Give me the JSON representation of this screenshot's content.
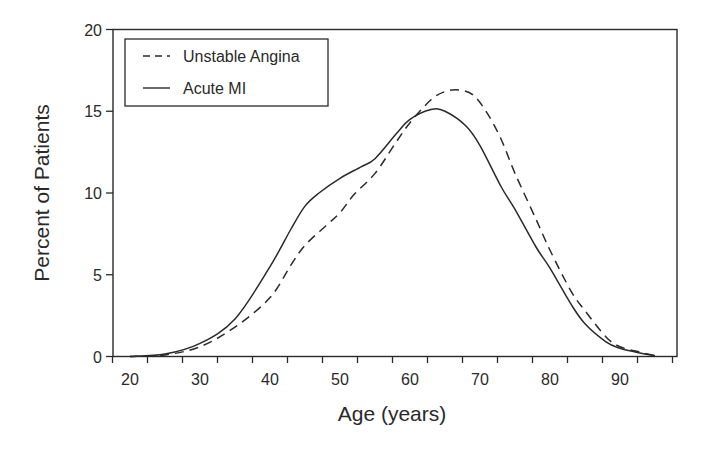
{
  "chart_data": {
    "type": "line",
    "title": "",
    "xlabel": "Age (years)",
    "ylabel": "Percent of Patients",
    "xlim": [
      17.6,
      97.9
    ],
    "ylim": [
      0,
      20
    ],
    "x_ticks": [
      20,
      30,
      40,
      50,
      60,
      70,
      80,
      90
    ],
    "y_ticks": [
      0,
      5,
      10,
      15,
      20
    ],
    "grid": false,
    "legend_position": "upper-left",
    "series": [
      {
        "name": "Unstable Angina",
        "style": "dashed",
        "color": "#2a2a2a",
        "x": [
          20,
          25,
          30,
          35,
          40,
          43,
          45,
          48,
          50,
          52,
          55,
          58,
          60,
          63,
          65,
          67,
          69,
          71,
          73,
          75,
          78,
          80,
          83,
          85,
          88,
          90,
          93,
          95
        ],
        "y": [
          0,
          0.1,
          0.6,
          1.8,
          3.6,
          5.6,
          6.8,
          8.0,
          8.8,
          9.9,
          11.2,
          13.1,
          14.3,
          15.7,
          16.2,
          16.3,
          16.0,
          14.9,
          13.3,
          11.2,
          8.4,
          6.5,
          4.0,
          2.8,
          1.2,
          0.6,
          0.25,
          0.05
        ]
      },
      {
        "name": "Acute MI",
        "style": "solid",
        "color": "#2a2a2a",
        "x": [
          20,
          25,
          30,
          35,
          40,
          43,
          45,
          47,
          50,
          53,
          55,
          58,
          60,
          63,
          65,
          68,
          70,
          73,
          75,
          78,
          80,
          83,
          85,
          88,
          90,
          93,
          95
        ],
        "y": [
          0,
          0.15,
          0.8,
          2.3,
          5.5,
          7.8,
          9.2,
          10.0,
          10.9,
          11.6,
          12.1,
          13.6,
          14.5,
          15.1,
          15.0,
          14.1,
          12.9,
          10.4,
          9.0,
          6.7,
          5.4,
          3.2,
          2.0,
          0.9,
          0.5,
          0.2,
          0.05
        ]
      }
    ]
  },
  "legend": {
    "items": [
      {
        "label": "Unstable Angina",
        "style": "dashed"
      },
      {
        "label": "Acute MI",
        "style": "solid"
      }
    ]
  },
  "axes": {
    "x_title": "Age (years)",
    "y_title": "Percent of Patients",
    "x_tick_labels": [
      "20",
      "30",
      "40",
      "50",
      "60",
      "70",
      "80",
      "90"
    ],
    "y_tick_labels": [
      "0",
      "5",
      "10",
      "15",
      "20"
    ]
  }
}
